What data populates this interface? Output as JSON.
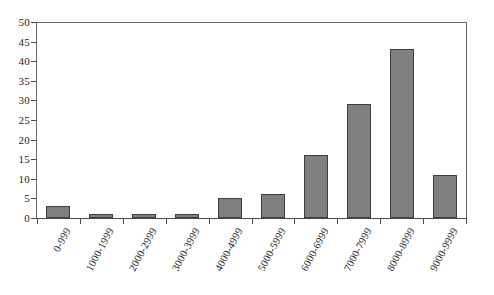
{
  "chart_data": {
    "type": "bar",
    "title": "",
    "subtitle": "",
    "xlabel": "",
    "ylabel": "",
    "categories": [
      "0-999",
      "1000-1999",
      "2000-2999",
      "3000-3999",
      "4000-4999",
      "5000-5999",
      "6000-6999",
      "7000-7999",
      "8000-8999",
      "9000-9999"
    ],
    "values": [
      3,
      1,
      1,
      1,
      5,
      6,
      16,
      29,
      43,
      11
    ],
    "ylim": [
      0,
      50
    ],
    "ytick_values": [
      0,
      5,
      10,
      15,
      20,
      25,
      30,
      35,
      40,
      45,
      50
    ],
    "ytick_labels": [
      "0",
      "5",
      "10",
      "15",
      "20",
      "25",
      "30",
      "35",
      "40",
      "45",
      "50"
    ],
    "grid": false,
    "legend": null,
    "legend_position": "none",
    "annotations": [],
    "series": [
      {
        "name": "",
        "values": [
          3,
          1,
          1,
          1,
          5,
          6,
          16,
          29,
          43,
          11
        ],
        "color": "#808080",
        "edge_color": "#3d3d3d"
      }
    ]
  },
  "style": {
    "bar_fill": "#808080",
    "bar_edge": "#3d3d3d",
    "axis_color": "#4a4a4a",
    "frame_color": "#6a6a6a",
    "text_color": "#1b1b1b",
    "background": "#ffffff",
    "label_rotation_degrees": "-62"
  }
}
